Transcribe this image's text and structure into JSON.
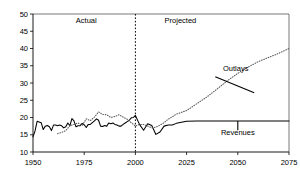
{
  "chart_data": {
    "type": "line",
    "title": "",
    "xlabel": "",
    "ylabel": "",
    "xlim": [
      1950,
      2075
    ],
    "ylim": [
      10,
      50
    ],
    "xticks": [
      1950,
      1975,
      2000,
      2025,
      2050,
      2075
    ],
    "yticks": [
      10,
      15,
      20,
      25,
      30,
      35,
      40,
      45,
      50
    ],
    "grid": false,
    "legend_position": "none",
    "annotations": [
      {
        "text": "Actual",
        "x": 1976,
        "y": 47.5
      },
      {
        "text": "Projected",
        "x": 2022,
        "y": 47.5
      },
      {
        "text": "Outlays",
        "x": 2049,
        "y": 33.5
      },
      {
        "text": "Revenues",
        "x": 2050,
        "y": 14.8
      }
    ],
    "divider_year": 2000,
    "series": [
      {
        "name": "Revenues",
        "style": "solid",
        "x": [
          1950,
          1951,
          1952,
          1953,
          1954,
          1955,
          1956,
          1957,
          1958,
          1959,
          1960,
          1961,
          1962,
          1963,
          1964,
          1965,
          1966,
          1967,
          1968,
          1969,
          1970,
          1971,
          1972,
          1973,
          1974,
          1975,
          1976,
          1977,
          1978,
          1979,
          1980,
          1981,
          1982,
          1983,
          1984,
          1985,
          1986,
          1987,
          1988,
          1989,
          1990,
          1991,
          1992,
          1993,
          1994,
          1995,
          1996,
          1997,
          1998,
          1999,
          2000,
          2002,
          2004,
          2006,
          2008,
          2010,
          2012,
          2014,
          2016,
          2018,
          2020,
          2025,
          2030,
          2035,
          2040,
          2045,
          2050,
          2055,
          2060,
          2065,
          2070,
          2075
        ],
        "values": [
          14.4,
          16.1,
          18.9,
          18.7,
          18.5,
          16.5,
          17.5,
          17.7,
          17.3,
          16.2,
          17.8,
          17.8,
          17.6,
          17.8,
          17.6,
          17.0,
          17.3,
          18.4,
          17.6,
          19.7,
          19.0,
          17.3,
          17.6,
          17.6,
          18.3,
          17.9,
          17.1,
          18.0,
          18.0,
          18.5,
          19.0,
          19.6,
          19.2,
          17.5,
          17.4,
          17.7,
          17.5,
          18.4,
          18.2,
          18.4,
          18.0,
          17.8,
          17.5,
          17.5,
          18.0,
          18.4,
          18.8,
          19.2,
          19.9,
          20.0,
          20.6,
          18.0,
          16.3,
          18.2,
          17.7,
          15.1,
          15.8,
          17.5,
          17.8,
          17.8,
          18.3,
          18.9,
          19.0,
          19.0,
          19.0,
          19.0,
          19.0,
          19.0,
          19.0,
          19.0,
          19.0,
          19.0
        ]
      },
      {
        "name": "Outlays",
        "style": "dotted",
        "x": [
          1962,
          1964,
          1966,
          1968,
          1970,
          1972,
          1974,
          1976,
          1978,
          1980,
          1982,
          1984,
          1986,
          1988,
          1990,
          1992,
          1994,
          1996,
          1998,
          2000,
          2002,
          2004,
          2006,
          2008,
          2010,
          2012,
          2014,
          2016,
          2018,
          2020,
          2025,
          2030,
          2035,
          2040,
          2045,
          2050,
          2055,
          2060,
          2065,
          2070,
          2075
        ],
        "values": [
          15.3,
          15.7,
          16.2,
          17.6,
          18.0,
          18.4,
          17.7,
          19.6,
          19.1,
          20.1,
          21.6,
          20.9,
          20.8,
          20.0,
          20.3,
          20.8,
          20.1,
          19.5,
          18.5,
          17.5,
          18.0,
          18.0,
          17.5,
          17.0,
          17.2,
          17.8,
          18.5,
          19.5,
          20.2,
          21.0,
          22.0,
          24.0,
          26.0,
          28.3,
          30.7,
          32.8,
          34.6,
          36.2,
          37.4,
          38.6,
          40.0
        ]
      }
    ]
  },
  "plot": {
    "frame_color": "#555555",
    "series_color": "#000000",
    "divider_label_actual": "Actual",
    "divider_label_projected": "Projected"
  }
}
